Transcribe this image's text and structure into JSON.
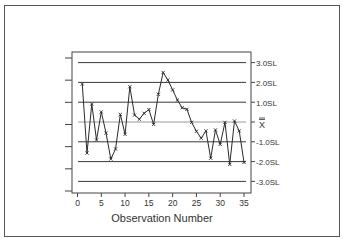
{
  "chart_data": {
    "type": "line",
    "title": "",
    "xlabel": "Observation Number",
    "ylabel": "",
    "x": [
      1,
      2,
      3,
      4,
      5,
      6,
      7,
      8,
      9,
      10,
      11,
      12,
      13,
      14,
      15,
      16,
      17,
      18,
      19,
      20,
      21,
      22,
      23,
      24,
      25,
      26,
      27,
      28,
      29,
      30,
      31,
      32,
      33,
      34,
      35
    ],
    "series": [
      {
        "name": "Observations",
        "marker": "x",
        "values": [
          1.92,
          -1.57,
          0.91,
          -0.91,
          0.51,
          -0.56,
          -1.87,
          -1.36,
          0.38,
          -0.62,
          1.78,
          0.35,
          0.14,
          0.44,
          0.63,
          -0.12,
          1.4,
          2.5,
          2.12,
          1.62,
          1.11,
          0.72,
          0.64,
          -0.02,
          -0.47,
          -0.82,
          -0.45,
          -1.83,
          -0.4,
          -1.13,
          -0.02,
          -2.14,
          0.05,
          -0.45,
          -2.04
        ]
      }
    ],
    "xticks": [
      "0",
      "5",
      "10",
      "15",
      "20",
      "25",
      "30",
      "35"
    ],
    "xlim": [
      0,
      36
    ],
    "ylim": [
      -3.5,
      3.5
    ],
    "reference_lines": [
      {
        "label": "3.0SL",
        "value": 3
      },
      {
        "label": "2.0SL",
        "value": 2
      },
      {
        "label": "1.0SL",
        "value": 1
      },
      {
        "label": "X̿",
        "value": 0
      },
      {
        "label": "-1.0SL",
        "value": -1
      },
      {
        "label": "-2.0SL",
        "value": -2
      },
      {
        "label": "-3.0SL",
        "value": -3
      }
    ],
    "left_ticks_count": 7,
    "grid": false,
    "legend": "none"
  },
  "colors": {
    "line": "#2a2a2a",
    "sl_line": "#3a3a3a",
    "center_line": "#9a9a9a",
    "frame": "#444444",
    "text": "#333333"
  }
}
